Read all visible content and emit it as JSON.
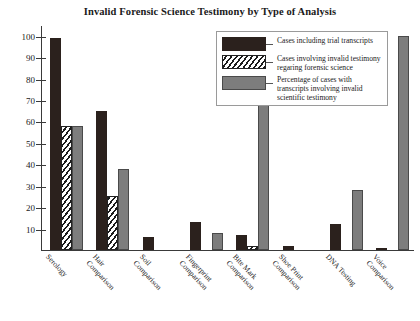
{
  "chart_data": {
    "type": "bar",
    "title": "Invalid Forensic Science Testimony by Type of Analysis",
    "xlabel": "",
    "ylabel": "",
    "ylim": [
      0,
      105
    ],
    "yticks": [
      10,
      20,
      30,
      40,
      50,
      60,
      70,
      80,
      90,
      100
    ],
    "grid": false,
    "legend_position": "top-right",
    "categories": [
      "Serology",
      "Hair Comparison",
      "Soil Comparison",
      "Fingerprint Comparison",
      "Bite Mark Comparison",
      "Shoe Print Comparison",
      "DNA Testing",
      "Voice Comparison"
    ],
    "series": [
      {
        "name": "Cases including trial transcripts",
        "values": [
          99,
          65,
          6,
          13,
          7,
          2,
          12,
          1
        ]
      },
      {
        "name": "Cases involving invalid testimony regaring forensic science",
        "values": [
          58,
          25,
          0,
          0,
          2,
          0,
          0,
          0
        ]
      },
      {
        "name": "Percentage of cases with transcripts involving invalid scientific testimony",
        "values": [
          58,
          38,
          0,
          8,
          68,
          0,
          28,
          100
        ]
      }
    ]
  },
  "axis": {
    "ytick_labels": [
      "100",
      "90",
      "80",
      "70",
      "60",
      "50",
      "40",
      "30",
      "20",
      "10"
    ]
  },
  "category_labels": [
    {
      "lines": [
        "Serology"
      ]
    },
    {
      "lines": [
        "Hair",
        "Comparison"
      ]
    },
    {
      "lines": [
        "Soil",
        "Comparison"
      ]
    },
    {
      "lines": [
        "Fingerprint",
        "Comparison"
      ]
    },
    {
      "lines": [
        "Bite Mark",
        "Comparison"
      ]
    },
    {
      "lines": [
        "Shoe Print",
        "Comparison"
      ]
    },
    {
      "lines": [
        "DNA Testing"
      ]
    },
    {
      "lines": [
        "Voice",
        "Comparison"
      ]
    }
  ],
  "legend": {
    "entries": [
      {
        "swatch": "s0",
        "label": "Cases including trial transcripts"
      },
      {
        "swatch": "s1",
        "label": "Cases involving invalid testimony regaring forensic science"
      },
      {
        "swatch": "s2",
        "label": "Percentage of cases with transcripts involving invalid scientific testimony"
      }
    ]
  }
}
